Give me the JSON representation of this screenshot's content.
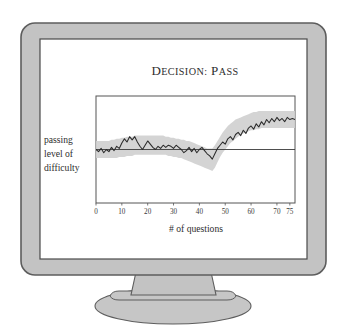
{
  "device": {
    "type": "crt-monitor-illustration",
    "bezel_color": "#c3c3c3",
    "bezel_outline_color": "#5d5d5d",
    "screen_color": "#ffffff",
    "screen_border_color": "#4a4a4a",
    "stand_color": "#c3c3c3",
    "base_color": "#c9c9c9"
  },
  "screen": {
    "title": "Decision: Pass",
    "title_parts": {
      "word1_cap": "D",
      "word1_rest": "ECISION",
      "colon": ":",
      "word2_cap": "P",
      "word2_rest": "ASS"
    },
    "y_axis_label_lines": [
      "passing",
      "level of",
      "difficulty"
    ],
    "x_axis_label": "# of questions"
  },
  "chart_data": {
    "type": "line",
    "title": "Decision: Pass",
    "xlabel": "# of questions",
    "ylabel": "passing level of difficulty",
    "xlim": [
      0,
      77
    ],
    "ylim": [
      0,
      100
    ],
    "xticks": [
      0,
      10,
      20,
      30,
      40,
      50,
      60,
      70,
      75
    ],
    "xtick_labels": [
      "0",
      "10",
      "20",
      "30",
      "40",
      "50",
      "60",
      "70",
      "75"
    ],
    "yticks": [],
    "ytick_labels": [],
    "grid": false,
    "legend": false,
    "reference_line": {
      "name": "passing level of difficulty",
      "orientation": "horizontal",
      "value": 50,
      "color": "#3a3a3a"
    },
    "band": {
      "name": "confidence band",
      "color": "#cfcfcf",
      "opacity": 0.85,
      "lower": [
        42,
        42,
        42,
        42,
        42,
        42,
        42,
        42,
        42,
        43,
        43,
        43,
        44,
        44,
        44,
        45,
        45,
        45,
        45,
        45,
        45,
        45,
        45,
        45,
        45,
        45,
        45,
        45,
        44,
        44,
        43,
        43,
        42,
        42,
        41,
        40,
        39,
        38,
        37,
        36,
        35,
        34,
        33,
        32,
        31,
        30,
        33,
        38,
        43,
        47,
        50,
        53,
        56,
        58,
        60,
        62,
        64,
        65,
        66,
        67,
        68,
        68,
        69,
        69,
        70,
        70,
        70,
        70,
        70,
        70,
        70,
        70,
        70,
        70,
        70,
        70,
        70,
        70
      ],
      "upper": [
        58,
        58,
        58,
        58,
        58,
        58,
        59,
        59,
        60,
        60,
        61,
        61,
        62,
        62,
        62,
        63,
        63,
        63,
        63,
        63,
        63,
        63,
        63,
        63,
        63,
        63,
        63,
        62,
        62,
        61,
        61,
        60,
        60,
        59,
        59,
        58,
        58,
        57,
        56,
        55,
        54,
        53,
        52,
        51,
        51,
        51,
        54,
        58,
        62,
        66,
        69,
        72,
        74,
        76,
        78,
        79,
        80,
        81,
        82,
        83,
        84,
        85,
        85,
        86,
        86,
        86,
        86,
        86,
        86,
        86,
        86,
        86,
        86,
        86,
        86,
        86,
        86,
        86
      ]
    },
    "series": [
      {
        "name": "estimated difficulty",
        "color": "#2a2a2a",
        "x": [
          0,
          1,
          2,
          3,
          4,
          5,
          6,
          7,
          8,
          9,
          10,
          11,
          12,
          13,
          14,
          15,
          16,
          17,
          18,
          19,
          20,
          21,
          22,
          23,
          24,
          25,
          26,
          27,
          28,
          29,
          30,
          31,
          32,
          33,
          34,
          35,
          36,
          37,
          38,
          39,
          40,
          41,
          42,
          43,
          44,
          45,
          46,
          47,
          48,
          49,
          50,
          51,
          52,
          53,
          54,
          55,
          56,
          57,
          58,
          59,
          60,
          61,
          62,
          63,
          64,
          65,
          66,
          67,
          68,
          69,
          70,
          71,
          72,
          73,
          74,
          75,
          76,
          77
        ],
        "values": [
          50,
          48,
          51,
          47,
          50,
          48,
          52,
          49,
          53,
          51,
          56,
          60,
          57,
          62,
          59,
          62,
          57,
          53,
          50,
          54,
          58,
          55,
          52,
          50,
          53,
          51,
          54,
          52,
          54,
          53,
          51,
          54,
          52,
          50,
          47,
          49,
          52,
          48,
          51,
          47,
          50,
          52,
          49,
          46,
          44,
          41,
          46,
          51,
          54,
          57,
          55,
          60,
          62,
          59,
          64,
          66,
          63,
          68,
          65,
          70,
          72,
          69,
          74,
          71,
          76,
          73,
          78,
          75,
          79,
          76,
          80,
          77,
          79,
          76,
          80,
          78,
          79,
          78
        ]
      }
    ]
  }
}
